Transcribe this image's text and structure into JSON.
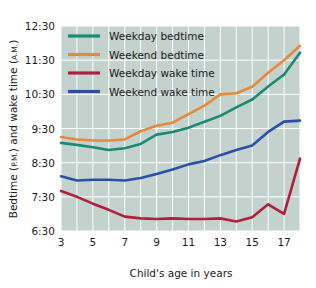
{
  "chart_data": {
    "type": "line",
    "title": "",
    "xlabel": "Child's age in years",
    "ylabel": "Bedtime (P.M.) and wake time (A.M.)",
    "ylabel_main": "Bedtime (",
    "ylabel_pm": "P.M.",
    "ylabel_mid": ") and wake time (",
    "ylabel_am": "A.M.",
    "ylabel_end": ")",
    "x": [
      3,
      4,
      5,
      6,
      7,
      8,
      9,
      10,
      11,
      12,
      13,
      14,
      15,
      16,
      17,
      18
    ],
    "xlim": [
      3,
      18
    ],
    "xticks": [
      3,
      5,
      7,
      9,
      11,
      13,
      15,
      17
    ],
    "xticklabels": [
      "3",
      "5",
      "7",
      "9",
      "11",
      "13",
      "15",
      "17"
    ],
    "ylim": [
      6.5,
      12.5
    ],
    "yticks": [
      6.5,
      7.5,
      8.5,
      9.5,
      10.5,
      11.5,
      12.5
    ],
    "yticklabels": [
      "6:30",
      "7:30",
      "8:30",
      "9:30",
      "10:30",
      "11:30",
      "12:30"
    ],
    "grid": true,
    "grid_color": "#ffffff",
    "plot_background": "#c3d2cd",
    "legend_position": "top-left",
    "series": [
      {
        "name": "Weekday bedtime",
        "color": "#1b8a75",
        "values": [
          9.08,
          9.02,
          8.95,
          8.87,
          8.92,
          9.05,
          9.32,
          9.4,
          9.52,
          9.7,
          9.87,
          10.12,
          10.35,
          10.73,
          11.08,
          11.72
        ]
      },
      {
        "name": "Weekend bedtime",
        "color": "#e8883a",
        "values": [
          9.25,
          9.18,
          9.15,
          9.15,
          9.18,
          9.42,
          9.58,
          9.67,
          9.92,
          10.17,
          10.5,
          10.53,
          10.72,
          11.13,
          11.5,
          11.92
        ]
      },
      {
        "name": "Weekday wake time",
        "color": "#b01f3c",
        "values": [
          7.67,
          7.5,
          7.3,
          7.12,
          6.92,
          6.87,
          6.85,
          6.87,
          6.85,
          6.85,
          6.87,
          6.78,
          6.9,
          7.28,
          7.0,
          8.62
        ]
      },
      {
        "name": "Weekend wake time",
        "color": "#2b4fa8",
        "values": [
          8.1,
          7.98,
          8.0,
          8.0,
          7.98,
          8.05,
          8.17,
          8.3,
          8.45,
          8.55,
          8.72,
          8.87,
          9.0,
          9.4,
          9.7,
          9.73
        ]
      }
    ]
  }
}
